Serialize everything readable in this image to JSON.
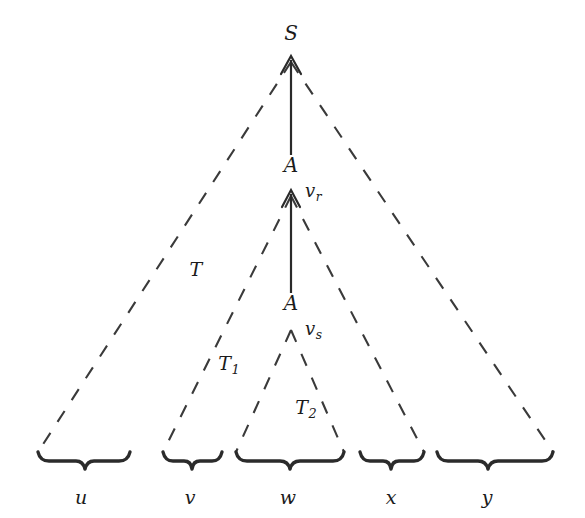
{
  "figure": {
    "kind": "parse-tree-diagram",
    "background_color": "#ffffff",
    "ink_color": "#1b1b1b"
  },
  "nodes": [
    {
      "id": "root",
      "label": "S",
      "x": 291,
      "y": 33
    },
    {
      "id": "inner1",
      "label": "A",
      "x": 291,
      "y": 165
    },
    {
      "id": "inner2",
      "label": "A",
      "x": 291,
      "y": 303
    }
  ],
  "edge_labels": [
    {
      "id": "vr",
      "base": "v",
      "sub": "r",
      "x": 305,
      "y": 193
    },
    {
      "id": "vs",
      "base": "v",
      "sub": "s",
      "x": 305,
      "y": 331
    }
  ],
  "region_labels": [
    {
      "id": "T",
      "base": "T",
      "sub": "",
      "x": 196,
      "y": 272
    },
    {
      "id": "T1",
      "base": "T",
      "sub": "1",
      "x": 229,
      "y": 366
    },
    {
      "id": "T2",
      "base": "T",
      "sub": "2",
      "x": 306,
      "y": 410
    }
  ],
  "yield_labels": [
    {
      "id": "u",
      "label": "u",
      "x": 81,
      "y": 497
    },
    {
      "id": "v",
      "label": "v",
      "x": 190,
      "y": 497
    },
    {
      "id": "w",
      "label": "w",
      "x": 288,
      "y": 497
    },
    {
      "id": "x",
      "label": "x",
      "x": 391,
      "y": 497
    },
    {
      "id": "y",
      "label": "y",
      "x": 487,
      "y": 497
    }
  ],
  "braces": [
    {
      "id": "brace-u",
      "x1": 38,
      "x2": 128,
      "y": 459
    },
    {
      "id": "brace-v",
      "x1": 163,
      "x2": 222,
      "y": 459
    },
    {
      "id": "brace-w",
      "x1": 236,
      "x2": 344,
      "y": 459
    },
    {
      "id": "brace-x",
      "x1": 360,
      "x2": 424,
      "y": 459
    },
    {
      "id": "brace-y",
      "x1": 437,
      "x2": 553,
      "y": 459
    }
  ],
  "triangles": [
    {
      "id": "T",
      "apex_x": 291,
      "apex_y": 62,
      "left_x": 38,
      "right_x": 553,
      "base_y": 452
    },
    {
      "id": "T1",
      "apex_x": 291,
      "apex_y": 196,
      "left_x": 163,
      "right_x": 424,
      "base_y": 452
    },
    {
      "id": "T2",
      "apex_x": 291,
      "apex_y": 330,
      "left_x": 236,
      "right_x": 344,
      "base_y": 452
    }
  ],
  "arrows": [
    {
      "id": "arrow-s-a",
      "x": 291,
      "y_tail": 155,
      "y_head": 57
    },
    {
      "id": "arrow-a-a",
      "x": 291,
      "y_tail": 293,
      "y_head": 191
    }
  ]
}
